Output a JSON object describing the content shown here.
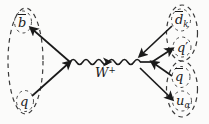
{
  "figure": {
    "kind": "feynman-diagram",
    "background_color": "#fbfbfa",
    "line_color": "#1a1a1a",
    "dashed_group_color": "#3a3a3a",
    "width": 209,
    "height": 124
  },
  "labels": {
    "b_antiquark": {
      "base": "b",
      "overbar": true,
      "text": "b̄"
    },
    "spectator_quark": {
      "base": "q",
      "overbar": false,
      "text": "q"
    },
    "boson": {
      "base": "W",
      "superscript": "+",
      "text": "W⁺"
    },
    "d_antiquark": {
      "base": "d",
      "overbar": true,
      "subscript": "k",
      "text": "d̄ₖ"
    },
    "q_prime": {
      "base": "q",
      "prime": "′",
      "text": "q′"
    },
    "q_antiquark": {
      "base": "q",
      "overbar": true,
      "text": "q̄"
    },
    "u_quark": {
      "base": "u",
      "subscript": "α",
      "text": "uₐ"
    }
  },
  "groups": [
    {
      "name": "initial-meson",
      "members": [
        "b̄",
        "q"
      ],
      "style": "dashed-ellipse"
    },
    {
      "name": "final-meson-upper",
      "members": [
        "d̄ₖ",
        "q′"
      ],
      "style": "dashed-ellipse"
    },
    {
      "name": "final-meson-lower",
      "members": [
        "q̄",
        "uₐ"
      ],
      "style": "dashed-ellipse"
    }
  ],
  "lines": [
    {
      "name": "b-antiquark-line",
      "arrow_direction": "up-left"
    },
    {
      "name": "spectator-quark-line",
      "arrow_direction": "up-right"
    },
    {
      "name": "w-propagator",
      "style": "wavy",
      "arrow_direction": "right"
    },
    {
      "name": "d-antiquark-line",
      "arrow_direction": "down-left"
    },
    {
      "name": "q-prime-line",
      "arrow_direction": "up-right"
    },
    {
      "name": "q-antiquark-line",
      "arrow_direction": "up-left"
    },
    {
      "name": "u-quark-line",
      "arrow_direction": "down-right"
    }
  ]
}
